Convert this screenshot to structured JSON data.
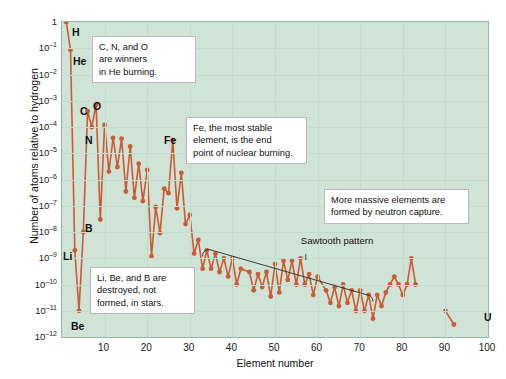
{
  "figure": {
    "background_color": "#ffffff",
    "plot_background_color": "#cfe3d7",
    "series_color": "#cc5a33",
    "grid_color": "#c3dbcc"
  },
  "axes": {
    "xlabel": "Element number",
    "ylabel": "Number of atoms relative to hydrogen",
    "xticks": [
      "0",
      "10",
      "20",
      "30",
      "40",
      "50",
      "60",
      "70",
      "80",
      "90",
      "100"
    ],
    "xlim": [
      0,
      100
    ],
    "yticks": [
      {
        "mantissa": "1",
        "exp": ""
      },
      {
        "mantissa": "10",
        "exp": "–1"
      },
      {
        "mantissa": "10",
        "exp": "–2"
      },
      {
        "mantissa": "10",
        "exp": "–3"
      },
      {
        "mantissa": "10",
        "exp": "–4"
      },
      {
        "mantissa": "10",
        "exp": "–5"
      },
      {
        "mantissa": "10",
        "exp": "–6"
      },
      {
        "mantissa": "10",
        "exp": "–7"
      },
      {
        "mantissa": "10",
        "exp": "–8"
      },
      {
        "mantissa": "10",
        "exp": "–9"
      },
      {
        "mantissa": "10",
        "exp": "–10"
      },
      {
        "mantissa": "10",
        "exp": "–11"
      },
      {
        "mantissa": "10",
        "exp": "–12"
      }
    ],
    "ylim_exp": [
      0,
      -12
    ]
  },
  "callouts": [
    {
      "id": "cno",
      "text": "C, N, and O\nare winners\nin He burning.",
      "x": 92,
      "y": 36,
      "w": 104,
      "h": 44
    },
    {
      "id": "iron",
      "text": "Fe, the most stable\nelement, is the end\npoint of nuclear burning.",
      "x": 186,
      "y": 117,
      "w": 121,
      "h": 44
    },
    {
      "id": "neutron-capture",
      "text": "More massive elements are\nformed by neutron capture.",
      "x": 324,
      "y": 189,
      "w": 145,
      "h": 32
    },
    {
      "id": "light-elements",
      "text": "Li, Be, and B are\ndestroyed, not\nformed, in stars.",
      "x": 90,
      "y": 267,
      "w": 105,
      "h": 45
    }
  ],
  "annotations": {
    "sawtooth_label": "Sawtooth pattern"
  },
  "element_labels": [
    {
      "symbol": "H",
      "x": 72,
      "y": 32
    },
    {
      "symbol": "He",
      "x": 73,
      "y": 61
    },
    {
      "symbol": "C",
      "x": 80,
      "y": 111
    },
    {
      "symbol": "O",
      "x": 93,
      "y": 106
    },
    {
      "symbol": "N",
      "x": 85,
      "y": 140
    },
    {
      "symbol": "Fe",
      "x": 164,
      "y": 140
    },
    {
      "symbol": "B",
      "x": 85,
      "y": 228
    },
    {
      "symbol": "Li",
      "x": 63,
      "y": 256
    },
    {
      "symbol": "Be",
      "x": 71,
      "y": 326
    },
    {
      "symbol": "U",
      "x": 484,
      "y": 317
    }
  ],
  "chart_data": {
    "type": "line",
    "title": "",
    "xlabel": "Element number",
    "ylabel": "Number of atoms relative to hydrogen",
    "xlim": [
      0,
      100
    ],
    "ylim": [
      1e-12,
      1
    ],
    "yscale": "log",
    "grid": true,
    "legend": null,
    "series": [
      {
        "name": "Solar-system abundance relative to hydrogen",
        "color": "#cc5a33",
        "x": [
          1,
          2,
          3,
          4,
          5,
          6,
          7,
          8,
          9,
          10,
          11,
          12,
          13,
          14,
          15,
          16,
          17,
          18,
          19,
          20,
          21,
          22,
          23,
          24,
          25,
          26,
          27,
          28,
          29,
          30,
          31,
          32,
          33,
          34,
          35,
          36,
          37,
          38,
          39,
          40,
          41,
          42,
          44,
          45,
          46,
          47,
          48,
          49,
          50,
          51,
          52,
          53,
          54,
          55,
          56,
          57,
          58,
          59,
          60,
          62,
          63,
          64,
          65,
          66,
          67,
          68,
          69,
          70,
          71,
          72,
          73,
          74,
          75,
          76,
          77,
          78,
          79,
          80,
          81,
          82,
          83,
          90,
          92
        ],
        "values": [
          1.0,
          0.085,
          2e-09,
          1e-11,
          1e-08,
          0.0004,
          0.0001,
          0.0007,
          3e-08,
          0.00012,
          2e-06,
          3.8e-05,
          3e-06,
          3.6e-05,
          3.5e-07,
          1.8e-05,
          2e-07,
          4e-06,
          1.5e-07,
          2.3e-06,
          1.2e-09,
          9e-08,
          9e-09,
          4.5e-07,
          3e-07,
          3.2e-05,
          8e-08,
          1.8e-06,
          2e-08,
          4.5e-08,
          1.5e-09,
          5e-09,
          4e-10,
          2e-09,
          4e-10,
          1.5e-09,
          3e-10,
          1e-09,
          2e-10,
          1e-09,
          1e-10,
          4e-10,
          3e-10,
          6e-11,
          2.5e-10,
          8e-11,
          3e-10,
          3.5e-11,
          6e-10,
          5e-11,
          8e-10,
          1.5e-10,
          8e-10,
          1e-10,
          1e-09,
          1e-10,
          2.5e-10,
          4e-11,
          2e-10,
          6e-11,
          2e-11,
          8e-11,
          1.5e-11,
          1e-10,
          2e-11,
          6e-11,
          1e-11,
          6e-11,
          1e-11,
          4e-11,
          5e-12,
          4e-11,
          1.5e-11,
          5e-11,
          1e-10,
          2e-10,
          1e-10,
          4e-11,
          1e-10,
          1e-09,
          1e-10,
          1e-11,
          3e-12
        ]
      }
    ],
    "annotations": [
      {
        "text": "Sawtooth pattern",
        "type": "bracket",
        "x_range": [
          33,
          73
        ]
      },
      {
        "text": "C, N, and O are winners in He burning.",
        "type": "callout"
      },
      {
        "text": "Fe, the most stable element, is the end point of nuclear burning.",
        "type": "callout"
      },
      {
        "text": "More massive elements are formed by neutron capture.",
        "type": "callout"
      },
      {
        "text": "Li, Be, and B are destroyed, not formed, in stars.",
        "type": "callout"
      }
    ],
    "point_labels": [
      "H",
      "He",
      "C",
      "N",
      "O",
      "B",
      "Li",
      "Be",
      "Fe",
      "U"
    ]
  }
}
